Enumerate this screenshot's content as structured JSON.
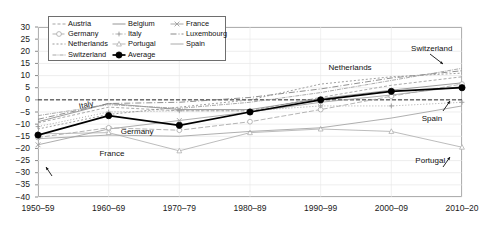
{
  "chart_data": {
    "type": "line",
    "title": "",
    "xlabel": "",
    "ylabel": "",
    "ylim": [
      -40,
      30
    ],
    "ytick_step": 5,
    "grid": true,
    "legend_position": "top-left-inside",
    "zero_reference_line": true,
    "categories": [
      "1950–59",
      "1960–69",
      "1970–79",
      "1980–89",
      "1990–99",
      "2000–09",
      "2010–20"
    ],
    "yticks": [
      "30",
      "25",
      "20",
      "15",
      "10",
      "5",
      "0",
      "−5",
      "−10",
      "−15",
      "−20",
      "−25",
      "−30",
      "−35",
      "−40"
    ],
    "series": [
      {
        "name": "Austria",
        "values": [
          -9.5,
          -3.0,
          -4.5,
          -4.5,
          1.0,
          6.0,
          9.5
        ],
        "color": "#9b9b9b",
        "dash": "3,2",
        "marker": "none"
      },
      {
        "name": "Belgium",
        "values": [
          -9.0,
          -1.5,
          -4.0,
          -4.0,
          0.5,
          4.0,
          7.0
        ],
        "color": "#8a8a8a",
        "dash": "none",
        "marker": "none"
      },
      {
        "name": "France",
        "values": [
          -18.5,
          -12.0,
          -8.5,
          -5.0,
          -1.0,
          2.0,
          5.5
        ],
        "color": "#9e9e9e",
        "dash": "none",
        "marker": "x"
      },
      {
        "name": "Germany",
        "values": [
          -15.5,
          -11.5,
          -12.5,
          -9.0,
          -4.0,
          1.5,
          6.5
        ],
        "color": "#a8a8a8",
        "dash": "5,2",
        "marker": "circle-open"
      },
      {
        "name": "Italy",
        "values": [
          -11.0,
          -5.0,
          -4.5,
          -4.5,
          -2.5,
          -2.5,
          -1.0
        ],
        "color": "#9a9a9a",
        "dash": "1,2",
        "marker": "plus"
      },
      {
        "name": "Luxembourg",
        "values": [
          -8.0,
          -1.5,
          -1.0,
          1.0,
          4.5,
          9.0,
          12.0
        ],
        "color": "#7d7d7d",
        "dash": "6,2,1,2",
        "marker": "none"
      },
      {
        "name": "Netherlands",
        "values": [
          -12.0,
          -6.0,
          -3.0,
          0.0,
          6.5,
          9.5,
          11.0
        ],
        "color": "#909090",
        "dash": "2,2",
        "marker": "none"
      },
      {
        "name": "Portugal",
        "values": [
          -14.0,
          -13.5,
          -21.0,
          -13.5,
          -12.0,
          -13.0,
          -19.5
        ],
        "color": "#b0b0b0",
        "dash": "none",
        "marker": "triangle-open"
      },
      {
        "name": "Spain",
        "values": [
          -16.0,
          -14.5,
          -15.0,
          -13.0,
          -11.5,
          -7.5,
          -2.5
        ],
        "color": "#a0a0a0",
        "dash": "none",
        "marker": "none"
      },
      {
        "name": "Switzerland",
        "values": [
          -6.5,
          -2.0,
          -3.5,
          -1.0,
          3.0,
          8.0,
          13.0
        ],
        "color": "#9c9c9c",
        "dash": "4,1,1,1",
        "marker": "none"
      },
      {
        "name": "Average",
        "values": [
          -14.5,
          -6.5,
          -10.5,
          -5.0,
          0.0,
          3.5,
          5.0
        ],
        "color": "#000000",
        "dash": "none",
        "marker": "circle-filled"
      }
    ],
    "annotations": [
      {
        "label": "Italy",
        "x_pct": 10.0,
        "y_pct": 44.0,
        "arrow": false
      },
      {
        "label": "Germany",
        "x_pct": 19.5,
        "y_pct": 59.0,
        "arrow": false
      },
      {
        "label": "France",
        "x_pct": 14.5,
        "y_pct": 72.0,
        "arrow": true
      },
      {
        "label": "Netherlands",
        "x_pct": 68.5,
        "y_pct": 21.0,
        "arrow": false
      },
      {
        "label": "Switzerland",
        "x_pct": 88.0,
        "y_pct": 10.0,
        "arrow": true
      },
      {
        "label": "Spain",
        "x_pct": 90.5,
        "y_pct": 51.0,
        "arrow": true
      },
      {
        "label": "Portugal",
        "x_pct": 89.0,
        "y_pct": 76.0,
        "arrow": true
      }
    ]
  }
}
